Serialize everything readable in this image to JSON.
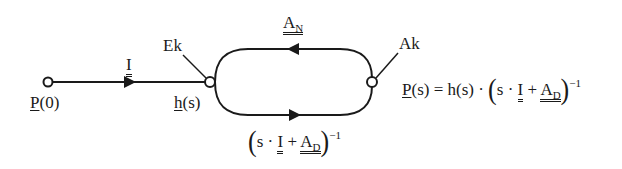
{
  "diagram": {
    "type": "signal-flow-graph",
    "nodes": {
      "start": {
        "label_main": "P",
        "label_rest": "(0)"
      },
      "ek": {
        "label": "Ek",
        "sub_label_main": "h",
        "sub_label_rest": "(s)"
      },
      "ak": {
        "label": "Ak"
      }
    },
    "edges": {
      "input": {
        "label": "I"
      },
      "feedback_top": {
        "label_main": "A",
        "label_sub": "N"
      },
      "forward_bottom": {
        "open": "(",
        "s": "s ·",
        "I": "I",
        "plus": "+",
        "A": "A",
        "A_sub": "D",
        "close": ")",
        "exp": "−1"
      }
    },
    "equation": {
      "lhs_main": "P",
      "lhs_rest": "(s) = h(s) ·",
      "open": "(",
      "s": "s ·",
      "I": "I",
      "plus": "+",
      "A": "A",
      "A_sub": "D",
      "close": ")",
      "exp": "−1"
    },
    "colors": {
      "stroke": "#1a1a1a",
      "background": "#ffffff"
    }
  }
}
